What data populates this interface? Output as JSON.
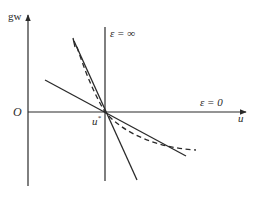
{
  "diagram": {
    "type": "phase-diagram",
    "axes": {
      "y_label": "gw",
      "x_label": "u",
      "origin_label": "O"
    },
    "point": {
      "label": "u",
      "superscript": "*"
    },
    "annotations": {
      "epsilon_infinity": "ε = ∞",
      "epsilon_zero": "ε = 0"
    },
    "elements": [
      {
        "name": "vertical-line",
        "style": "solid",
        "meaning": "ε = ∞"
      },
      {
        "name": "horizontal-axis",
        "style": "solid",
        "meaning": "ε = 0"
      },
      {
        "name": "steep-line",
        "style": "solid"
      },
      {
        "name": "shallow-line",
        "style": "solid"
      },
      {
        "name": "curve",
        "style": "dashed"
      }
    ],
    "colors": {
      "ink": "#2a2a2a",
      "background": "#ffffff"
    }
  }
}
